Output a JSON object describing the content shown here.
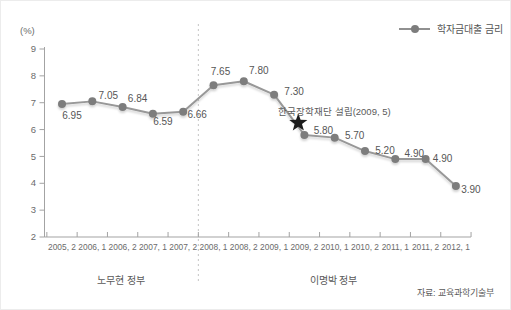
{
  "chart_data": {
    "type": "line",
    "title": "",
    "unit_label": "(%)",
    "legend_label": "학자금대출 금리",
    "legend_position": "top-right",
    "categories": [
      "2005, 2",
      "2006, 1",
      "2006, 2",
      "2007, 1",
      "2007, 2",
      "2008, 1",
      "2008, 2",
      "2009, 1",
      "2009, 2",
      "2010, 1",
      "2010, 2",
      "2011, 1",
      "2011, 2",
      "2012, 1"
    ],
    "series": [
      {
        "name": "학자금대출 금리",
        "values": [
          6.95,
          7.05,
          6.84,
          6.59,
          6.66,
          7.65,
          7.8,
          7.3,
          5.8,
          5.7,
          5.2,
          4.9,
          4.9,
          3.9
        ]
      }
    ],
    "ylim": [
      2,
      9
    ],
    "yticks": [
      2,
      3,
      4,
      5,
      6,
      7,
      8,
      9
    ],
    "grid": false,
    "annotation": {
      "text": "한국장학재단 설립(2009, 5)",
      "marker": "star",
      "between_categories": [
        "2009, 1",
        "2009, 2"
      ]
    },
    "divider_after_category": "2007, 2",
    "era_labels": [
      {
        "label": "노무현 정부"
      },
      {
        "label": "이명박 정부"
      }
    ],
    "source": "자료: 교육과학기술부",
    "colors": {
      "line": "#989898",
      "marker": "#7d7d7d",
      "value_label": "#565656",
      "axis": "#a3a3a3",
      "tick_label": "#6b6b6b",
      "divider": "#c4c4c4",
      "star": "#1c1c1c"
    },
    "label_offsets": [
      [
        10,
        11
      ],
      [
        16,
        -6
      ],
      [
        15,
        -9
      ],
      [
        10,
        8
      ],
      [
        14,
        3
      ],
      [
        7,
        -14
      ],
      [
        15,
        -11
      ],
      [
        20,
        -3
      ],
      [
        19,
        -4
      ],
      [
        20,
        -2
      ],
      [
        20,
        -1
      ],
      [
        19,
        -6
      ],
      [
        17,
        -1
      ],
      [
        15,
        4
      ]
    ]
  }
}
